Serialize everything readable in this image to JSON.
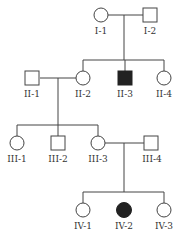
{
  "diagram": {
    "type": "pedigree",
    "colors": {
      "line": "#444444",
      "affected": "#222222",
      "unaffected": "#ffffff"
    },
    "generations": [
      {
        "label": "I",
        "members": [
          {
            "id": "I-1",
            "sex": "female",
            "affected": false
          },
          {
            "id": "I-2",
            "sex": "male",
            "affected": false
          }
        ]
      },
      {
        "label": "II",
        "members": [
          {
            "id": "II-1",
            "sex": "male",
            "affected": false
          },
          {
            "id": "II-2",
            "sex": "female",
            "affected": false
          },
          {
            "id": "II-3",
            "sex": "male",
            "affected": true
          },
          {
            "id": "II-4",
            "sex": "female",
            "affected": false
          }
        ]
      },
      {
        "label": "III",
        "members": [
          {
            "id": "III-1",
            "sex": "female",
            "affected": false
          },
          {
            "id": "III-2",
            "sex": "male",
            "affected": false
          },
          {
            "id": "III-3",
            "sex": "female",
            "affected": false
          },
          {
            "id": "III-4",
            "sex": "male",
            "affected": false
          }
        ]
      },
      {
        "label": "IV",
        "members": [
          {
            "id": "IV-1",
            "sex": "female",
            "affected": false
          },
          {
            "id": "IV-2",
            "sex": "female",
            "affected": true
          },
          {
            "id": "IV-3",
            "sex": "female",
            "affected": false
          }
        ]
      }
    ],
    "labels": {
      "I1": "I-1",
      "I2": "I-2",
      "II1": "II-1",
      "II2": "II-2",
      "II3": "II-3",
      "II4": "II-4",
      "III1": "III-1",
      "III2": "III-2",
      "III3": "III-3",
      "III4": "III-4",
      "IV1": "IV-1",
      "IV2": "IV-2",
      "IV3": "IV-3"
    },
    "marriages": [
      [
        "I-1",
        "I-2"
      ],
      [
        "II-1",
        "II-2"
      ],
      [
        "III-3",
        "III-4"
      ]
    ]
  }
}
